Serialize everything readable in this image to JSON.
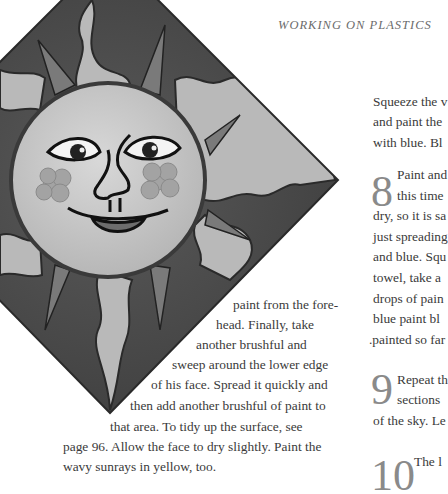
{
  "running_head": "WORKING ON PLASTICS",
  "figure": {
    "palette": {
      "background_dark": "#4a4a4a",
      "face": "#c9c9c9",
      "rays_light": "#b8b8b8",
      "rays_dark": "#6e6e6e",
      "outline": "#1e1e1e",
      "cheeks": "#9a9a9a"
    }
  },
  "left_column": {
    "lines": [
      "paint from the fore-",
      "head. Finally, take",
      "another brushful and",
      "sweep around the lower edge",
      "of his face. Spread it quickly and",
      "then add another brushful of paint to",
      "that area. To tidy up the surface, see",
      "page 96. Allow the face to dry slightly. Paint the",
      "wavy sunrays in yellow, too."
    ]
  },
  "right_column": {
    "intro_lines": [
      "Squeeze the v",
      "and paint the",
      "with blue. Bl"
    ],
    "steps": [
      {
        "number": "8",
        "lines": [
          "Paint and",
          "this time",
          "dry, so it is sa",
          "just spreading",
          "and blue. Squ",
          "towel, take a",
          "drops of pain",
          "blue paint bl",
          ".painted so far"
        ]
      },
      {
        "number": "9",
        "lines": [
          "Repeat th",
          "sections",
          "of the sky. Le"
        ]
      },
      {
        "number": "10",
        "lines": [
          "The l"
        ]
      }
    ]
  }
}
